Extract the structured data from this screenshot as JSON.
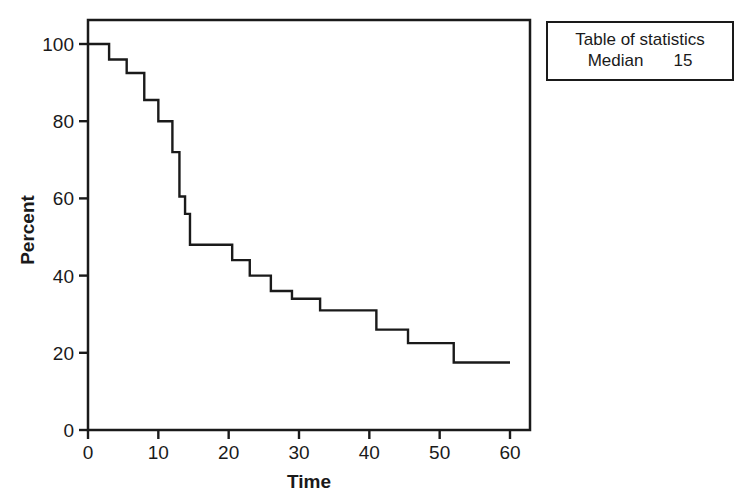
{
  "chart_data": {
    "type": "line",
    "subtype": "kaplan-meier-step",
    "title": "",
    "xlabel": "Time",
    "ylabel": "Percent",
    "xlim": [
      0,
      63
    ],
    "ylim": [
      0,
      105
    ],
    "xticks": [
      0,
      10,
      20,
      30,
      40,
      50,
      60
    ],
    "xticklabels": [
      "0",
      "10",
      "20",
      "30",
      "40",
      "50",
      "60"
    ],
    "yticks": [
      0,
      20,
      40,
      60,
      80,
      100
    ],
    "yticklabels": [
      "0",
      "20",
      "40",
      "60",
      "80",
      "100"
    ],
    "grid": false,
    "legend": null,
    "series": [
      {
        "name": "Survival",
        "step": "post",
        "x": [
          0,
          3,
          5.5,
          8,
          10,
          12,
          13,
          13.8,
          14.5,
          16,
          20.5,
          23,
          26,
          29,
          33,
          37,
          41,
          45.5,
          52,
          60
        ],
        "y": [
          100,
          96,
          92.5,
          85.5,
          80,
          72,
          72,
          60.5,
          56,
          48,
          48,
          44,
          44,
          40,
          36,
          34,
          31,
          31,
          22.5,
          17.5
        ]
      }
    ],
    "steps": [
      {
        "t_start": 0,
        "t_end": 3,
        "percent": 100
      },
      {
        "t_start": 3,
        "t_end": 5.5,
        "percent": 96
      },
      {
        "t_start": 5.5,
        "t_end": 8,
        "percent": 92.5
      },
      {
        "t_start": 8,
        "t_end": 10,
        "percent": 85.5
      },
      {
        "t_start": 10,
        "t_end": 12,
        "percent": 80
      },
      {
        "t_start": 12,
        "t_end": 13,
        "percent": 72
      },
      {
        "t_start": 13,
        "t_end": 13.8,
        "percent": 60.5
      },
      {
        "t_start": 13.8,
        "t_end": 14.5,
        "percent": 56
      },
      {
        "t_start": 14.5,
        "t_end": 20.5,
        "percent": 48
      },
      {
        "t_start": 20.5,
        "t_end": 23,
        "percent": 44
      },
      {
        "t_start": 23,
        "t_end": 26,
        "percent": 40
      },
      {
        "t_start": 26,
        "t_end": 29,
        "percent": 36
      },
      {
        "t_start": 29,
        "t_end": 33,
        "percent": 34
      },
      {
        "t_start": 33,
        "t_end": 41,
        "percent": 31
      },
      {
        "t_start": 41,
        "t_end": 45.5,
        "percent": 26
      },
      {
        "t_start": 45.5,
        "t_end": 52,
        "percent": 22.5
      },
      {
        "t_start": 52,
        "t_end": 60,
        "percent": 17.5
      }
    ],
    "line_color": "#1a1a1a",
    "axis_color": "#1a1a1a",
    "background": "#ffffff"
  },
  "stats_table": {
    "title": "Table of statistics",
    "rows": [
      {
        "label": "Median",
        "value": "15"
      }
    ]
  },
  "axes": {
    "y_title": "Percent",
    "x_title": "Time",
    "x_tick_labels": [
      "0",
      "10",
      "20",
      "30",
      "40",
      "50",
      "60"
    ],
    "y_tick_labels": [
      "0",
      "20",
      "40",
      "60",
      "80",
      "100"
    ]
  }
}
